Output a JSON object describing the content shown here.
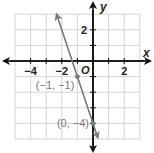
{
  "chart_data": {
    "type": "line",
    "title": "",
    "xlabel": "x",
    "ylabel": "y",
    "xlim": [
      -5,
      3
    ],
    "ylim": [
      -5,
      3
    ],
    "grid": true,
    "origin_label": "O",
    "x_ticks": [
      -4,
      -3,
      -2,
      -1,
      1,
      2
    ],
    "y_ticks": [
      2,
      1,
      -1,
      -2,
      -3,
      -4
    ],
    "x_tick_labels": [
      {
        "value": -4,
        "label": "−4"
      },
      {
        "value": -2,
        "label": "−2"
      },
      {
        "value": 2,
        "label": "2"
      }
    ],
    "y_tick_labels": [
      {
        "value": 2,
        "label": "2"
      }
    ],
    "series": [
      {
        "name": "line",
        "equation": "y = -3x - 4",
        "slope": -3,
        "intercept": -4,
        "x_range": [
          -2.33,
          0.3
        ],
        "arrows": "both",
        "color": "#7a7a7a"
      }
    ],
    "points": [
      {
        "x": -1,
        "y": -1,
        "label": "(−1, −1)"
      },
      {
        "x": 0,
        "y": -4,
        "label": "(0, −4)"
      }
    ],
    "colors": {
      "axis": "#111111",
      "grid": "#d4d4d4",
      "line": "#7a7a7a",
      "point": "#7a7a7a",
      "label": "#777777"
    }
  }
}
